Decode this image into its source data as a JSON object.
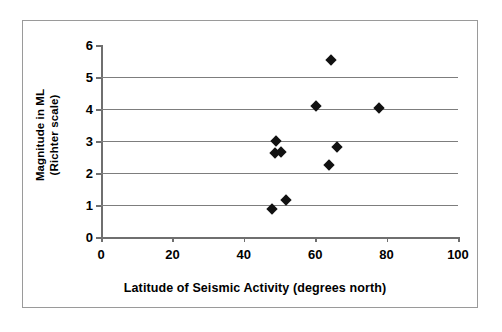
{
  "chart_data": {
    "type": "scatter",
    "title": "",
    "xlabel": "Latitude of Seismic Activity (degrees north)",
    "ylabel": "Magnitude in ML (Richter scale)",
    "ylabel_lines": [
      "Magnitude in ML",
      "(Richter scale)"
    ],
    "xlim": [
      0,
      100
    ],
    "ylim": [
      0,
      6
    ],
    "xticks": [
      0,
      20,
      40,
      60,
      80,
      100
    ],
    "yticks": [
      0,
      1,
      2,
      3,
      4,
      5,
      6
    ],
    "xtick_labels": [
      "0",
      "20",
      "40",
      "60",
      "80",
      "100"
    ],
    "ytick_labels": [
      "0",
      "1",
      "2",
      "3",
      "4",
      "5",
      "6"
    ],
    "grid": "horizontal",
    "legend": "none",
    "marker": "black-filled-diamond",
    "marker_color": "#111111",
    "gridline_color": "#7d7d7d",
    "axis_color": "#6f6f6f",
    "frame_color": "#9a9a9a",
    "background": "#ffffff",
    "points": [
      {
        "x": 48.0,
        "y": 0.87
      },
      {
        "x": 51.8,
        "y": 1.15
      },
      {
        "x": 48.7,
        "y": 2.62
      },
      {
        "x": 50.3,
        "y": 2.65
      },
      {
        "x": 49.0,
        "y": 3.0
      },
      {
        "x": 63.8,
        "y": 2.25
      },
      {
        "x": 66.0,
        "y": 2.82
      },
      {
        "x": 60.3,
        "y": 4.1
      },
      {
        "x": 77.8,
        "y": 4.02
      },
      {
        "x": 64.5,
        "y": 5.52
      }
    ]
  }
}
